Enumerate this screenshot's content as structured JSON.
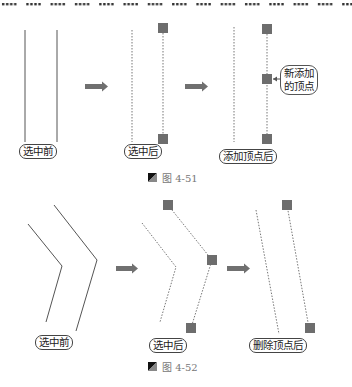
{
  "figures": [
    {
      "id": "4-51",
      "caption": "图 4-51",
      "panels": [
        {
          "label": "选中前"
        },
        {
          "label": "选中后"
        },
        {
          "label": "添加顶点后",
          "callout": [
            "新添加",
            "的顶点"
          ]
        }
      ]
    },
    {
      "id": "4-52",
      "caption": "图 4-52",
      "panels": [
        {
          "label": "选中前"
        },
        {
          "label": "选中后"
        },
        {
          "label": "删除顶点后"
        }
      ]
    }
  ],
  "colors": {
    "line": "#555555",
    "vertex": "#6d6d6d",
    "arrow": "#707070",
    "caption": "#777777"
  },
  "icons": {
    "arrow": "right-arrow-icon",
    "vertex": "vertex-square-icon",
    "caption": "figure-marker-icon"
  }
}
